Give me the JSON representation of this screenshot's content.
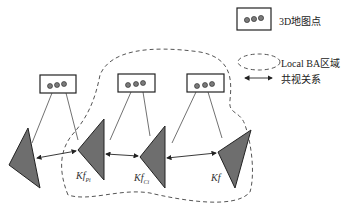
{
  "legend": {
    "map_point_label": "3D地图点",
    "local_ba_label": "Local BA区域",
    "covisibility_label": "共视关系"
  },
  "keyframes": [
    {
      "name": "",
      "sub": ""
    },
    {
      "name": "Kf",
      "sub": "Pi"
    },
    {
      "name": "Kf",
      "sub": "Ci"
    },
    {
      "name": "Kf",
      "sub": ""
    }
  ],
  "colors": {
    "triangle_fill": "#6e6e6e",
    "dot_fill": "#7a7a7a",
    "stroke": "#222222",
    "dashed": "#555555"
  }
}
